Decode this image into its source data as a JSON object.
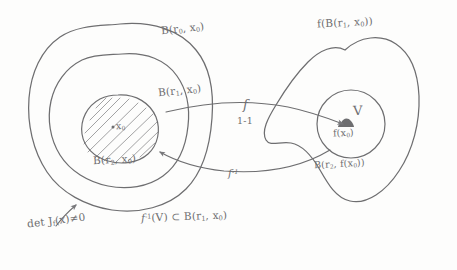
{
  "figure": {
    "kind": "hand-drawn-mathematical-diagram",
    "ink_color": "#6e6e70",
    "paper_color": "#fdfdfc"
  },
  "domain_region": {
    "outer_ball_label": "B(r",
    "outer_ball_sub": "0",
    "outer_ball_tail": ", x",
    "outer_ball_sub2": "0",
    "outer_ball_close": ")",
    "middle_ball_label": "B(r",
    "middle_ball_sub": "1",
    "middle_ball_tail": ", x",
    "middle_ball_sub2": "0",
    "middle_ball_close": ")",
    "inner_ball_label": "B(r",
    "inner_ball_sub": "2",
    "inner_ball_tail": ", x",
    "inner_ball_sub2": "0",
    "inner_ball_close": ")",
    "center_point_label": "x",
    "center_point_sub": "0",
    "center_point_dot": "·"
  },
  "codomain_region": {
    "image_blob_label": "f(B(r",
    "image_blob_sub": "1",
    "image_blob_tail": ", x",
    "image_blob_sub2": "0",
    "image_blob_close": "))",
    "neighborhood_label": "V",
    "image_point_label": "f(x",
    "image_point_sub": "0",
    "image_point_close": ")",
    "image_ball_label": "B(r",
    "image_ball_sub": "2",
    "image_ball_tail": ", f(x",
    "image_ball_sub2": "0",
    "image_ball_close": "))"
  },
  "arrows": {
    "forward_label": "f",
    "forward_sublabel": "1-1",
    "inverse_label": "f",
    "inverse_superscript": "-1"
  },
  "annotations": {
    "jacobian_prefix": "det J",
    "jacobian_sub": "f",
    "jacobian_arg": "(x)",
    "jacobian_relation": "≠0",
    "preimage_label": "f",
    "preimage_sup": "-1",
    "preimage_arg": "(V)",
    "preimage_relation": "⊂",
    "preimage_target": "B(r",
    "preimage_target_sub": "1",
    "preimage_target_tail": ", x",
    "preimage_target_sub2": "0",
    "preimage_target_close": ")"
  }
}
